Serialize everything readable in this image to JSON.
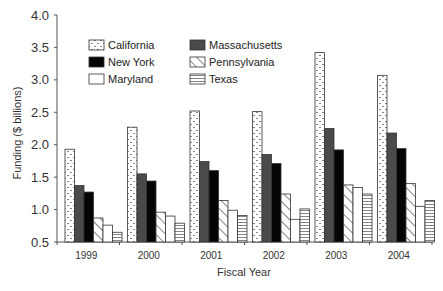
{
  "chart_data": {
    "type": "bar",
    "title": "",
    "xlabel": "Fiscal Year",
    "ylabel": "Funding ($ billions)",
    "ylim": [
      0.5,
      4.0
    ],
    "yticks": [
      0.5,
      1.0,
      1.5,
      2.0,
      2.5,
      3.0,
      3.5,
      4.0
    ],
    "ytick_labels": [
      "0.5",
      "1.0",
      "1.5",
      "2.0",
      "2.5",
      "3.0",
      "3.5",
      "4.0"
    ],
    "grid": false,
    "legend_position": "upper-left, inside plot, two columns",
    "categories": [
      "1999",
      "2000",
      "2001",
      "2002",
      "2003",
      "2004"
    ],
    "series": [
      {
        "name": "California",
        "pattern": "dotted",
        "values": [
          1.93,
          2.27,
          2.52,
          2.51,
          3.42,
          3.07
        ]
      },
      {
        "name": "Massachusetts",
        "pattern": "dark-gray",
        "values": [
          1.37,
          1.55,
          1.74,
          1.85,
          2.25,
          2.18
        ]
      },
      {
        "name": "New York",
        "pattern": "black",
        "values": [
          1.27,
          1.44,
          1.6,
          1.71,
          1.92,
          1.94
        ]
      },
      {
        "name": "Pennsylvania",
        "pattern": "diagonal",
        "values": [
          0.87,
          0.96,
          1.14,
          1.24,
          1.38,
          1.4
        ]
      },
      {
        "name": "Maryland",
        "pattern": "white",
        "values": [
          0.76,
          0.9,
          0.99,
          0.85,
          1.34,
          1.05
        ]
      },
      {
        "name": "Texas",
        "pattern": "horizontal",
        "values": [
          0.65,
          0.79,
          0.91,
          1.01,
          1.24,
          1.14
        ]
      }
    ]
  },
  "legend": {
    "items": [
      {
        "label": "California",
        "pattern": "dotted",
        "col": 0,
        "row": 0
      },
      {
        "label": "Massachusetts",
        "pattern": "dark-gray",
        "col": 1,
        "row": 0
      },
      {
        "label": "New York",
        "pattern": "black",
        "col": 0,
        "row": 1
      },
      {
        "label": "Pennsylvania",
        "pattern": "diagonal",
        "col": 1,
        "row": 1
      },
      {
        "label": "Maryland",
        "pattern": "white",
        "col": 0,
        "row": 2
      },
      {
        "label": "Texas",
        "pattern": "horizontal",
        "col": 1,
        "row": 2
      }
    ]
  },
  "colors": {
    "axis": "#555555",
    "bar_stroke": "#333333",
    "dark_gray": "#4a4a4a",
    "black": "#050505",
    "white": "#ffffff"
  }
}
